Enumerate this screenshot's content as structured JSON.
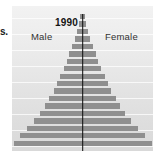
{
  "edge_fragment": {
    "text": "s."
  },
  "chart": {
    "title": "1990",
    "left_label": "Male",
    "right_label": "Female",
    "colors": {
      "bar": "#8f8f8f",
      "axis_line": "#0b0b0b",
      "background_top": "#f2f2f2",
      "background_bottom": "#d9d9d9",
      "gridline": "#ffffff",
      "text": "#333333",
      "title_text": "#141414"
    }
  },
  "chart_data": {
    "type": "bar",
    "chart_subtype": "population-pyramid",
    "title": "1990",
    "xlabel": "",
    "ylabel": "",
    "grid": true,
    "legend_position": "inline-top",
    "legend": [
      "Male",
      "Female"
    ],
    "categories": [
      "85+",
      "80-84",
      "75-79",
      "70-74",
      "65-69",
      "60-64",
      "55-59",
      "50-54",
      "45-49",
      "40-44",
      "35-39",
      "30-34",
      "25-29",
      "20-24",
      "15-19",
      "10-14",
      "5-9",
      "0-4"
    ],
    "series": [
      {
        "name": "Male",
        "side": "left",
        "values": [
          3,
          5,
          8,
          11,
          15,
          19,
          23,
          27,
          32,
          37,
          42,
          48,
          54,
          61,
          70,
          80,
          91,
          100
        ]
      },
      {
        "name": "Female",
        "side": "right",
        "values": [
          3,
          5,
          8,
          11,
          15,
          19,
          23,
          27,
          32,
          37,
          42,
          48,
          54,
          61,
          70,
          80,
          91,
          100
        ]
      }
    ],
    "value_units": "relative population (percent of widest cohort)",
    "xlim": [
      -100,
      100
    ]
  }
}
